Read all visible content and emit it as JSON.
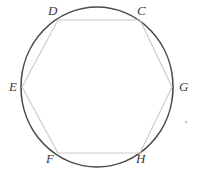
{
  "figure": {
    "background_color": "#ffffff",
    "circle": {
      "name": "circumscribed-circle",
      "center_x": 97,
      "center_y": 87,
      "radius_x": 76,
      "radius_y": 80,
      "stroke_color": "#4a4a4a",
      "stroke_width": 1.6
    },
    "polygon": {
      "name": "inscribed-hexagon",
      "sides": 6,
      "stroke_color": "#c9c9c9",
      "stroke_width": 1.1,
      "fill": "none",
      "points": "58,20 140,20 172,87 140,153 58,153 22,87"
    },
    "artifact_dot": {
      "name": "stray-mark",
      "x": 186,
      "y": 122,
      "radius": 1.2,
      "color": "#c0c0c0"
    }
  },
  "labels": [
    {
      "id": "label-D",
      "text": "D",
      "x": 48,
      "y": 4,
      "vertex_x": 58,
      "vertex_y": 20
    },
    {
      "id": "label-C",
      "text": "C",
      "x": 137,
      "y": 4,
      "vertex_x": 140,
      "vertex_y": 20
    },
    {
      "id": "label-E",
      "text": "E",
      "x": 9,
      "y": 80,
      "vertex_x": 22,
      "vertex_y": 87
    },
    {
      "id": "label-G",
      "text": "G",
      "x": 179,
      "y": 80,
      "vertex_x": 172,
      "vertex_y": 87
    },
    {
      "id": "label-F",
      "text": "F",
      "x": 46,
      "y": 152,
      "vertex_x": 58,
      "vertex_y": 153
    },
    {
      "id": "label-H",
      "text": "H",
      "x": 136,
      "y": 152,
      "vertex_x": 140,
      "vertex_y": 153
    }
  ]
}
